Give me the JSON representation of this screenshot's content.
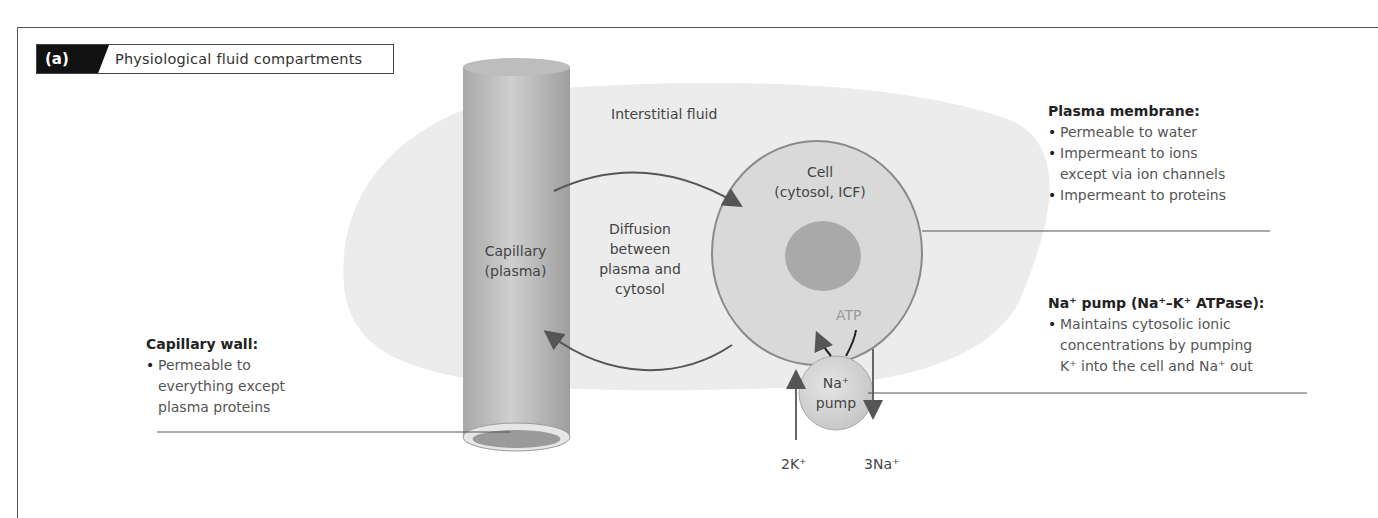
{
  "figure": {
    "panel_letter": "(a)",
    "title": "Physiological fluid compartments"
  },
  "labels": {
    "interstitial_fluid": "Interstitial fluid",
    "capillary_line1": "Capillary",
    "capillary_line2": "(plasma)",
    "cell_line1": "Cell",
    "cell_line2": "(cytosol, ICF)",
    "diffusion_line1": "Diffusion",
    "diffusion_line2": "between",
    "diffusion_line3": "plasma and",
    "diffusion_line4": "cytosol",
    "atp": "ATP",
    "pump_line1": "Na⁺",
    "pump_line2": "pump",
    "k_ions": "2K⁺",
    "na_ions": "3Na⁺"
  },
  "notes": {
    "plasma_membrane": {
      "heading": "Plasma membrane:",
      "items": [
        "Permeable to water",
        "Impermeant to ions",
        "except via ion channels",
        "Impermeant to proteins"
      ]
    },
    "na_pump": {
      "heading": "Na⁺ pump (Na⁺–K⁺ ATPase):",
      "items": [
        "Maintains cytosolic ionic",
        "concentrations by pumping",
        "K⁺ into the cell and Na⁺ out"
      ]
    },
    "capillary_wall": {
      "heading": "Capillary wall:",
      "items": [
        "Permeable to",
        "everything except",
        "plasma proteins"
      ]
    }
  },
  "colors": {
    "interstitial": "#ececec",
    "capillary": "#b8b8b8",
    "cell_fill": "#d9d9d9",
    "cell_border": "#8a8a8a",
    "nucleus": "#a9a9a9",
    "pump": "#d6d6d6",
    "arrow": "#555555"
  }
}
